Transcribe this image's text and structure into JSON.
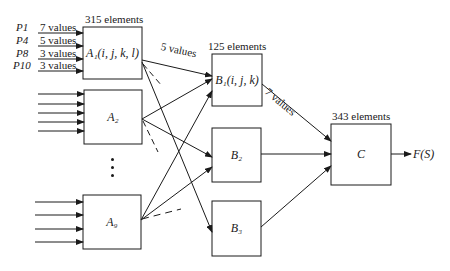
{
  "inputs": [
    {
      "param": "P1",
      "values": "7 values"
    },
    {
      "param": "P4",
      "values": "5 values"
    },
    {
      "param": "P8",
      "values": "3 values"
    },
    {
      "param": "P10",
      "values": "3 values"
    }
  ],
  "stage_a": {
    "elements": "315 elements",
    "boxes": [
      {
        "id": "A1",
        "label": "A₁(i, j, k, l)"
      },
      {
        "id": "A2",
        "label": "A₂"
      },
      {
        "id": "A9",
        "label": "A₉"
      }
    ],
    "output_values": "5 values"
  },
  "stage_b": {
    "elements": "125 elements",
    "boxes": [
      {
        "id": "B1",
        "label": "B₁(i, j, k)"
      },
      {
        "id": "B2",
        "label": "B₂"
      },
      {
        "id": "B3",
        "label": "B₃"
      }
    ],
    "output_values": "7 values"
  },
  "stage_c": {
    "elements": "343 elements",
    "box": {
      "id": "C",
      "label": "C"
    },
    "output": "F(S)"
  }
}
